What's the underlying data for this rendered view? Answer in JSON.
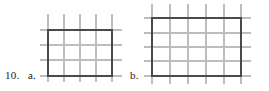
{
  "problem": {
    "number": "10.",
    "parts": [
      {
        "letter": "a.",
        "figure": "rectangle-on-grid"
      },
      {
        "letter": "b.",
        "figure": "rectangle-on-grid"
      }
    ]
  },
  "colors": {
    "grid_line": "#b8b8b8",
    "rectangle_stroke": "#4a4a4a",
    "text": "#1a1a1a",
    "background": "#ffffff"
  },
  "figures": {
    "a": {
      "label": "a.",
      "grid_cell_px": 16,
      "rect_cells_wide": 4,
      "rect_cells_tall": 3,
      "rect": {
        "x": 48,
        "y": 30,
        "width": 64,
        "height": 46
      },
      "grid_extent": {
        "x": 40,
        "y": 14,
        "width": 82,
        "height": 68
      },
      "grid_vertical_lines": [
        48,
        64,
        80,
        96,
        112
      ],
      "grid_horizontal_lines": [
        30,
        45,
        60,
        76
      ],
      "stroke_width": 2
    },
    "b": {
      "label": "b.",
      "grid_cell_px": 16,
      "rect_cells_wide": 5,
      "rect_cells_tall": 4,
      "rect": {
        "x": 152,
        "y": 18,
        "width": 89,
        "height": 58
      },
      "grid_extent": {
        "x": 144,
        "y": 4,
        "width": 107,
        "height": 80
      },
      "grid_vertical_lines": [
        152,
        170,
        188,
        206,
        224,
        241
      ],
      "grid_horizontal_lines": [
        18,
        33,
        47,
        61,
        76
      ],
      "stroke_width": 2
    }
  }
}
